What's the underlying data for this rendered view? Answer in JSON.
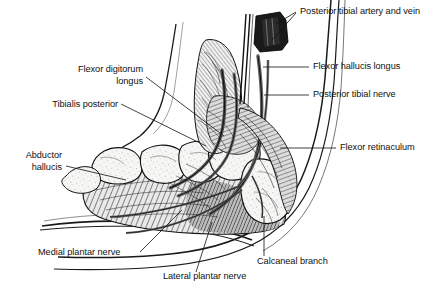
{
  "figure": {
    "background_color": "#ffffff",
    "ink_color": "#111111",
    "width": 443,
    "height": 296
  },
  "labels": [
    {
      "id": "posterior-tibial-artery-and-vein",
      "text": "Posterior tibial artery and vein",
      "align": "left",
      "x": 300,
      "y": 6
    },
    {
      "id": "flexor-hallucis-longus",
      "text": "Flexor hallucis longus",
      "align": "left",
      "x": 313,
      "y": 63
    },
    {
      "id": "posterior-tibial-nerve",
      "text": "Posterior tibial nerve",
      "align": "left",
      "x": 313,
      "y": 91
    },
    {
      "id": "flexor-retinaculum",
      "text": "Flexor retinaculum",
      "align": "left",
      "x": 340,
      "y": 144
    },
    {
      "id": "flexor-digitorum-longus",
      "text": "Flexor digitorum\nlongus",
      "align": "right",
      "x": 143,
      "y": 64
    },
    {
      "id": "tibialis-posterior",
      "text": "Tibialis posterior",
      "align": "right",
      "x": 118,
      "y": 104
    },
    {
      "id": "abductor-hallucis",
      "text": "Abductor\nhallucis",
      "align": "right",
      "x": 62,
      "y": 152
    },
    {
      "id": "medial-plantar-nerve",
      "text": "Medial plantar nerve",
      "align": "left",
      "x": 38,
      "y": 253
    },
    {
      "id": "lateral-plantar-nerve",
      "text": "Lateral plantar nerve",
      "align": "left",
      "x": 163,
      "y": 277
    },
    {
      "id": "calcaneal-branch",
      "text": "Calcaneal branch",
      "align": "left",
      "x": 257,
      "y": 262
    }
  ]
}
